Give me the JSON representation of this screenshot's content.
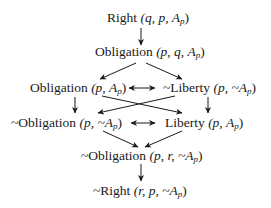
{
  "diagram": {
    "type": "deontic-implication-lattice",
    "nodes": [
      {
        "id": "n1",
        "relation": "Right",
        "negated": false,
        "args": "(q, p, A",
        "sub": "p",
        "close": ")"
      },
      {
        "id": "n2",
        "relation": "Obligation",
        "negated": false,
        "args": "(p, q, A",
        "sub": "p",
        "close": ")"
      },
      {
        "id": "n3",
        "relation": "Obligation",
        "negated": false,
        "args": "(p, A",
        "sub": "p",
        "close": ")"
      },
      {
        "id": "n4",
        "relation": "~Liberty",
        "negated": true,
        "args": "(p, ~A",
        "sub": "p",
        "close": ")"
      },
      {
        "id": "n5",
        "relation": "~Obligation",
        "negated": true,
        "args": "(p, ~A",
        "sub": "p",
        "close": ")"
      },
      {
        "id": "n6",
        "relation": "Liberty",
        "negated": false,
        "args": "(p, A",
        "sub": "p",
        "close": ")"
      },
      {
        "id": "n7",
        "relation": "~Obligation",
        "negated": true,
        "args": "(p, r, ~A",
        "sub": "p",
        "close": ")"
      },
      {
        "id": "n8",
        "relation": "~Right",
        "negated": true,
        "args": "(r, p, ~A",
        "sub": "p",
        "close": ")"
      }
    ],
    "edges": [
      {
        "from": "n1",
        "to": "n2",
        "kind": "implies"
      },
      {
        "from": "n2",
        "to": "n3",
        "kind": "implies"
      },
      {
        "from": "n2",
        "to": "n4",
        "kind": "implies"
      },
      {
        "from": "n3",
        "to": "n4",
        "kind": "equivalent"
      },
      {
        "from": "n3",
        "to": "n5",
        "kind": "implies"
      },
      {
        "from": "n3",
        "to": "n6",
        "kind": "implies"
      },
      {
        "from": "n4",
        "to": "n5",
        "kind": "implies"
      },
      {
        "from": "n4",
        "to": "n6",
        "kind": "implies"
      },
      {
        "from": "n5",
        "to": "n6",
        "kind": "equivalent"
      },
      {
        "from": "n5",
        "to": "n7",
        "kind": "implies"
      },
      {
        "from": "n6",
        "to": "n7",
        "kind": "implies"
      },
      {
        "from": "n7",
        "to": "n8",
        "kind": "implies"
      }
    ],
    "colors": {
      "ink": "#1a1a1a",
      "background": "#ffffff"
    }
  }
}
